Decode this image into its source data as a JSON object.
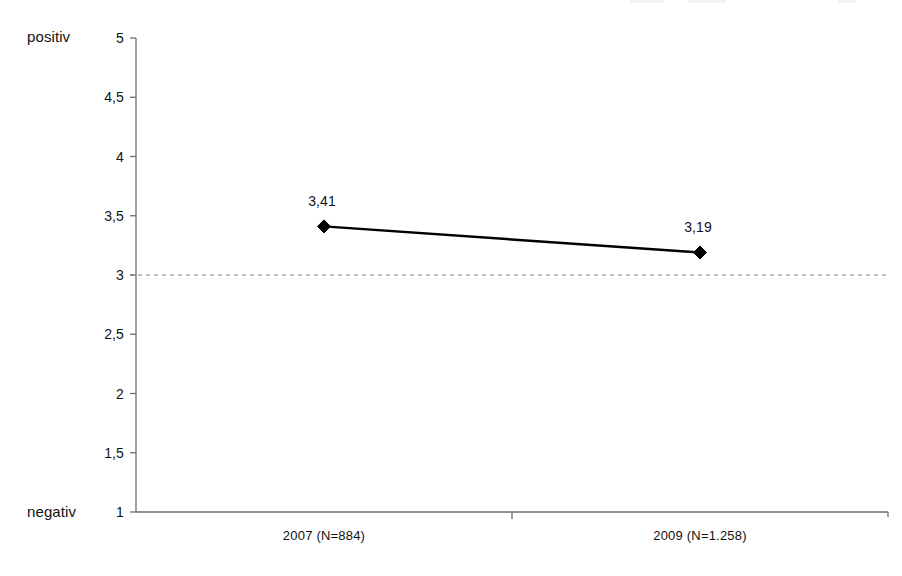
{
  "chart_data": {
    "type": "line",
    "title": "",
    "subtitle": "",
    "xlabel": "",
    "ylabel": "",
    "categories": [
      "2007 (N=884)",
      "2009 (N=1.258)"
    ],
    "series": [
      {
        "name": "",
        "values": [
          3.41,
          3.19
        ],
        "value_labels": [
          "3,41",
          "3,19"
        ],
        "marker": "diamond",
        "color": "#000000"
      }
    ],
    "ylim": [
      1,
      5
    ],
    "ytick_values": [
      5,
      4.5,
      4,
      3.5,
      3,
      2.5,
      2,
      1.5,
      1
    ],
    "ytick_labels": [
      "5",
      "4,5",
      "4",
      "3,5",
      "3",
      "2,5",
      "2",
      "1,5",
      "1"
    ],
    "axis_pole_labels": {
      "top": "positiv",
      "bottom": "negativ"
    },
    "reference_line": {
      "value": 3,
      "style": "dashed",
      "color": "#808080"
    },
    "grid": false,
    "legend": "none"
  },
  "axis": {
    "y_top_label": "positiv",
    "y_bottom_label": "negativ"
  }
}
